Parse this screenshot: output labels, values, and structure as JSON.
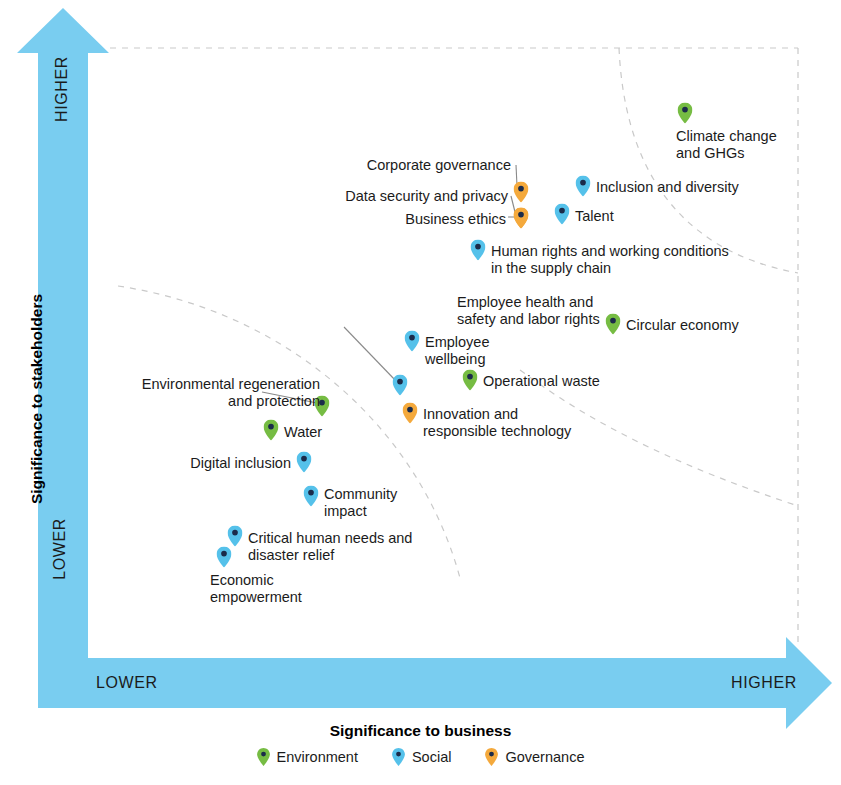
{
  "chart_data": {
    "type": "scatter",
    "title": "",
    "xlabel": "Significance to business",
    "ylabel": "Significance to stakeholders",
    "x_axis_low": "LOWER",
    "x_axis_high": "HIGHER",
    "y_axis_low": "LOWER",
    "y_axis_high": "HIGHER",
    "xlim": [
      0,
      100
    ],
    "ylim": [
      0,
      100
    ],
    "grid": false,
    "legend_position": "bottom-center",
    "legend": [
      {
        "name": "Environment",
        "color": "#76bc43"
      },
      {
        "name": "Social",
        "color": "#55c1ea"
      },
      {
        "name": "Governance",
        "color": "#f4a93c"
      }
    ],
    "points": [
      {
        "label": "Climate change\nand GHGs",
        "category": "Environment",
        "px": 685,
        "py": 113,
        "lx": 676,
        "ly": 128,
        "align": "right",
        "leader": false
      },
      {
        "label": "Inclusion and diversity",
        "category": "Social",
        "px": 583,
        "py": 186,
        "lx": 596,
        "ly": 179,
        "align": "right",
        "leader": false
      },
      {
        "label": "Talent",
        "category": "Social",
        "px": 562,
        "py": 214,
        "lx": 575,
        "ly": 208,
        "align": "right",
        "leader": false
      },
      {
        "label": "Corporate governance",
        "category": "Governance",
        "px": 521,
        "py": 192,
        "lx": 511,
        "ly": 157,
        "align": "left",
        "leader": true,
        "lead_x1": 516,
        "lead_y1": 165,
        "lead_x2": 517,
        "lead_y2": 186
      },
      {
        "label": "Data security and privacy",
        "category": "Governance",
        "px": 521,
        "py": 218,
        "lx": 508,
        "ly": 188,
        "align": "left",
        "leader": true,
        "lead_x1": 511,
        "lead_y1": 196,
        "lead_x2": 515,
        "lead_y2": 212
      },
      {
        "label": "Business ethics",
        "category": "Governance",
        "px": 521,
        "py": 218,
        "lx": 506,
        "ly": 211,
        "align": "left",
        "leader": true,
        "lead_x1": 508,
        "lead_y1": 217,
        "lead_x2": 514,
        "lead_y2": 217
      },
      {
        "label": "Human rights and working conditions\nin the supply chain",
        "category": "Social",
        "px": 478,
        "py": 250,
        "lx": 491,
        "ly": 243,
        "align": "right",
        "leader": false
      },
      {
        "label": "Circular economy",
        "category": "Environment",
        "px": 613,
        "py": 324,
        "lx": 626,
        "ly": 317,
        "align": "right",
        "leader": false
      },
      {
        "label": "Employee\nwellbeing",
        "category": "Social",
        "px": 412,
        "py": 341,
        "lx": 425,
        "ly": 334,
        "align": "right",
        "leader": false
      },
      {
        "label": "Operational waste",
        "category": "Environment",
        "px": 470,
        "py": 380,
        "lx": 483,
        "ly": 373,
        "align": "right",
        "leader": false
      },
      {
        "label": "Employee health and\nsafety and labor rights",
        "category": "Social",
        "px": 400,
        "py": 385,
        "lx": 457,
        "ly": 294,
        "align": "right",
        "leader": true,
        "lead_x1": 344,
        "lead_y1": 327,
        "lead_x2": 396,
        "lead_y2": 381
      },
      {
        "label": "Innovation and\nresponsible technology",
        "category": "Governance",
        "px": 410,
        "py": 413,
        "lx": 423,
        "ly": 406,
        "align": "right",
        "leader": false
      },
      {
        "label": "Environmental regeneration\nand protection",
        "category": "Environment",
        "px": 322,
        "py": 406,
        "lx": 320,
        "ly": 376,
        "align": "left",
        "leader": true,
        "lead_x1": 262,
        "lead_y1": 392,
        "lead_x2": 317,
        "lead_y2": 403
      },
      {
        "label": "Water",
        "category": "Environment",
        "px": 271,
        "py": 430,
        "lx": 284,
        "ly": 424,
        "align": "right",
        "leader": false
      },
      {
        "label": "Digital inclusion",
        "category": "Social",
        "px": 304,
        "py": 462,
        "lx": 291,
        "ly": 455,
        "align": "left",
        "leader": false
      },
      {
        "label": "Community\nimpact",
        "category": "Social",
        "px": 311,
        "py": 496,
        "lx": 324,
        "ly": 486,
        "align": "right",
        "leader": false
      },
      {
        "label": "Critical human needs and\ndisaster relief",
        "category": "Social",
        "px": 235,
        "py": 536,
        "lx": 248,
        "ly": 530,
        "align": "right",
        "leader": false
      },
      {
        "label": "Economic\nempowerment",
        "category": "Social",
        "px": 224,
        "py": 557,
        "lx": 210,
        "ly": 572,
        "align": "right",
        "leader": false
      }
    ]
  },
  "colors": {
    "axis_arrow": "#79cdf0",
    "environment": "#76bc43",
    "social": "#55c1ea",
    "governance": "#f4a93c",
    "marker_core": "#1b2b4a",
    "dashed_guide": "#c9c9c9",
    "text": "#1b1b1b"
  }
}
